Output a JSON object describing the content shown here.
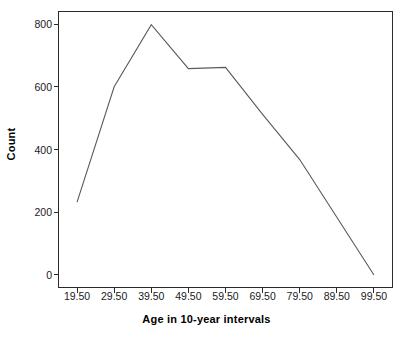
{
  "chart_data": {
    "type": "line",
    "title": "",
    "xlabel": "Age in 10-year intervals",
    "ylabel": "Count",
    "categories": [
      "19.50",
      "29.50",
      "39.50",
      "49.50",
      "59.50",
      "69.50",
      "79.50",
      "89.50",
      "99.50"
    ],
    "x": [
      19.5,
      29.5,
      39.5,
      49.5,
      59.5,
      69.5,
      79.5,
      89.5,
      99.5
    ],
    "values": [
      232,
      600,
      798,
      658,
      662,
      512,
      368,
      184,
      0
    ],
    "series": [
      {
        "name": "Count",
        "values": [
          232,
          600,
          798,
          658,
          662,
          512,
          368,
          184,
          0
        ]
      }
    ],
    "xlim": [
      14.5,
      104.5
    ],
    "ylim": [
      -40,
      840
    ],
    "yticks": [
      0,
      200,
      400,
      600,
      800
    ],
    "ytick_labels": [
      "0",
      "200",
      "400",
      "600",
      "800"
    ],
    "xticks": [
      19.5,
      29.5,
      39.5,
      49.5,
      59.5,
      69.5,
      79.5,
      89.5,
      99.5
    ],
    "xtick_labels": [
      "19.50",
      "29.50",
      "39.50",
      "49.50",
      "59.50",
      "69.50",
      "79.50",
      "89.50",
      "99.50"
    ],
    "grid": false,
    "legend": false,
    "legend_position": "none",
    "markers": false,
    "line_color": "#5a5a5a",
    "axis_color": "#2b2b2b",
    "background_color": "#ffffff"
  }
}
